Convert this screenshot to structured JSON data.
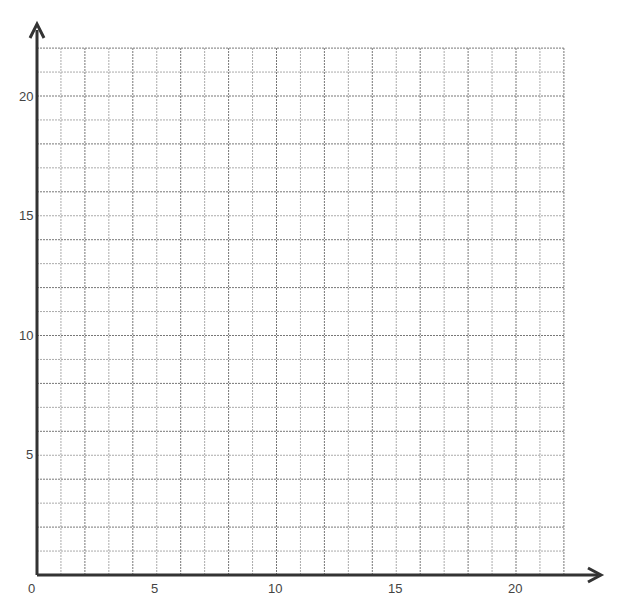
{
  "chart_data": {
    "type": "scatter",
    "title": "",
    "xlabel": "",
    "ylabel": "",
    "xlim": [
      0,
      22
    ],
    "ylim": [
      0,
      22
    ],
    "grid": true,
    "x_ticks": [
      "0",
      "5",
      "10",
      "15",
      "20"
    ],
    "y_ticks": [
      "5",
      "10",
      "15",
      "20"
    ],
    "series": []
  },
  "axis": {
    "origin_label": "0",
    "x5": "5",
    "x10": "10",
    "x15": "15",
    "x20": "20",
    "y5": "5",
    "y10": "10",
    "y15": "15",
    "y20": "20"
  }
}
